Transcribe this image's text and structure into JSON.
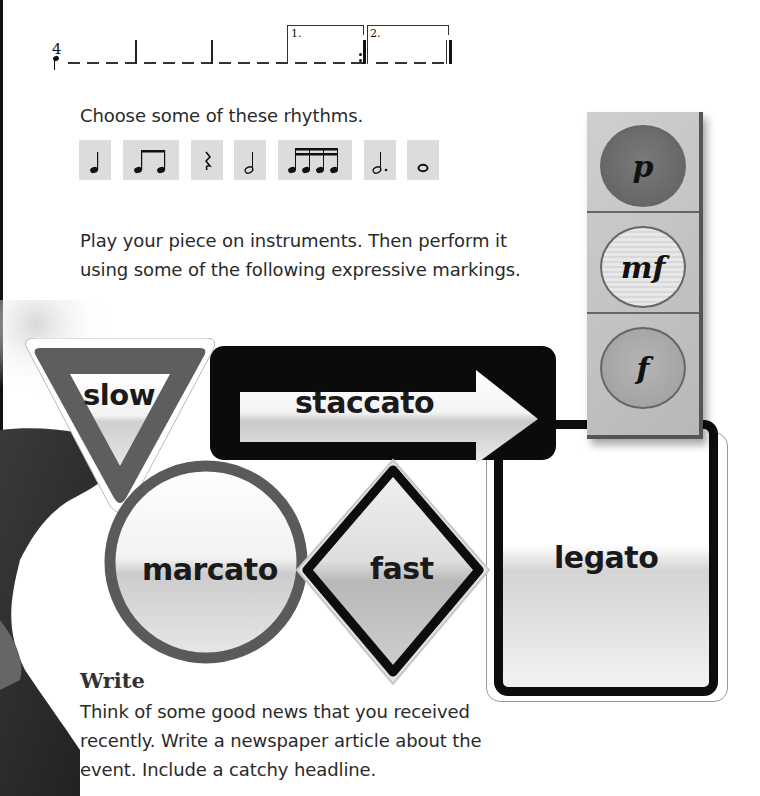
{
  "staff": {
    "time_signature": "4",
    "volta_labels": [
      "1.",
      "2."
    ],
    "measures": 5,
    "beats_per_measure": 4
  },
  "instructions": {
    "choose_rhythms": "Choose some of these rhythms.",
    "play_line1": "Play your piece on instruments. Then perform it",
    "play_line2": "using some of the following expressive markings."
  },
  "rhythms": [
    {
      "name": "quarter-note",
      "label": "crotchet"
    },
    {
      "name": "two-eighth-notes",
      "label": "two quavers"
    },
    {
      "name": "quarter-rest",
      "label": "crotchet rest"
    },
    {
      "name": "half-note",
      "label": "minim"
    },
    {
      "name": "four-sixteenth-notes",
      "label": "four semiquavers"
    },
    {
      "name": "dotted-half-note",
      "label": "dotted minim"
    },
    {
      "name": "whole-note",
      "label": "semibreve"
    }
  ],
  "traffic_light": {
    "lamps": [
      {
        "label": "p",
        "tone": "#6f6f6f"
      },
      {
        "label": "mf",
        "tone": "#e6e6e6"
      },
      {
        "label": "f",
        "tone": "#a9a9a9"
      }
    ]
  },
  "signs": {
    "slow": "slow",
    "staccato": "staccato",
    "marcato": "marcato",
    "fast": "fast",
    "legato": "legato"
  },
  "write": {
    "heading": "Write",
    "line1": "Think of some good news that you received",
    "line2": "recently. Write a newspaper article about the",
    "line3": "event. Include a catchy headline."
  }
}
